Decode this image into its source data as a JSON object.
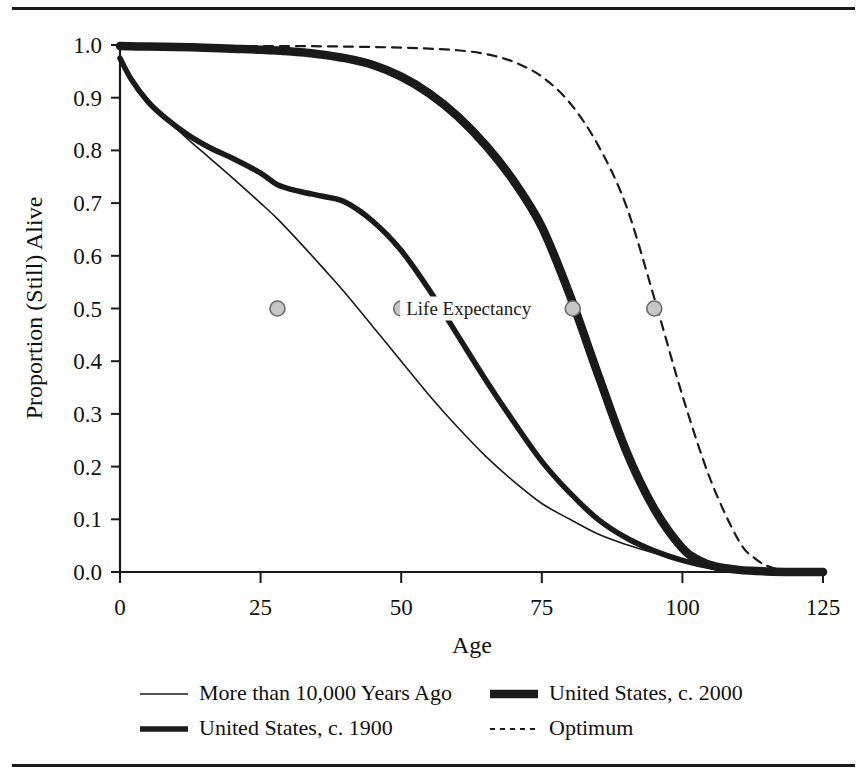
{
  "chart_data": {
    "type": "line",
    "title": "",
    "xlabel": "Age",
    "ylabel": "Proportion (Still) Alive",
    "xlim": [
      0,
      125
    ],
    "ylim": [
      0.0,
      1.0
    ],
    "grid": false,
    "legend_position": "bottom",
    "xticks": [
      "0",
      "25",
      "50",
      "75",
      "100",
      "125"
    ],
    "xtick_values": [
      0,
      25,
      50,
      75,
      100,
      125
    ],
    "yticks": [
      "0.0",
      "0.1",
      "0.2",
      "0.3",
      "0.4",
      "0.5",
      "0.6",
      "0.7",
      "0.8",
      "0.9",
      "1.0"
    ],
    "ytick_values": [
      0.0,
      0.1,
      0.2,
      0.3,
      0.4,
      0.5,
      0.6,
      0.7,
      0.8,
      0.9,
      1.0
    ],
    "annotations": [
      {
        "text": "Life Expectancy",
        "x": 62,
        "y": 0.5
      }
    ],
    "markers": {
      "label": "Life Expectancy",
      "y": 0.5,
      "fill": "#c6c6c6",
      "stroke": "#6b6b6b",
      "points": [
        {
          "series": "More than 10,000 Years Ago",
          "x": 28,
          "y": 0.5
        },
        {
          "series": "United States, c. 1900",
          "x": 50,
          "y": 0.5
        },
        {
          "series": "United States, c. 2000",
          "x": 80.5,
          "y": 0.5
        },
        {
          "series": "Optimum",
          "x": 95,
          "y": 0.5
        }
      ]
    },
    "series": [
      {
        "name": "More than 10,000 Years Ago",
        "style": "solid",
        "width": 1.6,
        "color": "#1a1a1a",
        "x": [
          0,
          2,
          5,
          8,
          12,
          16,
          20,
          25,
          28,
          32,
          36,
          40,
          45,
          50,
          55,
          60,
          65,
          70,
          75,
          80,
          85,
          90,
          95,
          100,
          105,
          110,
          115,
          120,
          125
        ],
        "y": [
          0.97,
          0.935,
          0.895,
          0.862,
          0.822,
          0.785,
          0.748,
          0.7,
          0.67,
          0.625,
          0.578,
          0.53,
          0.465,
          0.4,
          0.335,
          0.275,
          0.22,
          0.172,
          0.13,
          0.1,
          0.072,
          0.052,
          0.036,
          0.024,
          0.014,
          0.008,
          0.004,
          0.002,
          0.0
        ]
      },
      {
        "name": "United States, c. 1900",
        "style": "solid",
        "width": 5.5,
        "color": "#1a1a1a",
        "x": [
          0,
          2,
          5,
          8,
          12,
          16,
          20,
          25,
          28,
          32,
          36,
          40,
          45,
          50,
          55,
          60,
          65,
          70,
          75,
          80,
          85,
          90,
          95,
          100,
          105,
          110,
          115,
          120,
          125
        ],
        "y": [
          0.975,
          0.935,
          0.892,
          0.862,
          0.83,
          0.805,
          0.785,
          0.757,
          0.735,
          0.722,
          0.713,
          0.702,
          0.665,
          0.61,
          0.535,
          0.45,
          0.365,
          0.285,
          0.21,
          0.15,
          0.1,
          0.065,
          0.04,
          0.022,
          0.01,
          0.004,
          0.002,
          0.001,
          0.0
        ]
      },
      {
        "name": "United States, c. 2000",
        "style": "solid",
        "width": 8.5,
        "color": "#1a1a1a",
        "x": [
          0,
          5,
          10,
          15,
          20,
          25,
          30,
          35,
          40,
          45,
          50,
          55,
          60,
          65,
          70,
          75,
          80,
          85,
          90,
          95,
          100,
          103,
          106,
          110,
          115,
          120,
          125
        ],
        "y": [
          0.998,
          0.997,
          0.996,
          0.995,
          0.993,
          0.991,
          0.988,
          0.983,
          0.975,
          0.962,
          0.94,
          0.908,
          0.865,
          0.81,
          0.742,
          0.655,
          0.525,
          0.375,
          0.23,
          0.12,
          0.045,
          0.022,
          0.01,
          0.004,
          0.001,
          0.0,
          0.0
        ]
      },
      {
        "name": "Optimum",
        "style": "dashed",
        "width": 2.2,
        "color": "#1a1a1a",
        "x": [
          0,
          5,
          10,
          20,
          30,
          40,
          50,
          55,
          60,
          65,
          70,
          75,
          80,
          85,
          90,
          95,
          100,
          105,
          110,
          113,
          116,
          120,
          125
        ],
        "y": [
          0.999,
          0.999,
          0.999,
          0.998,
          0.998,
          0.997,
          0.995,
          0.993,
          0.99,
          0.983,
          0.968,
          0.94,
          0.89,
          0.81,
          0.695,
          0.52,
          0.335,
          0.175,
          0.06,
          0.025,
          0.008,
          0.0,
          0.0
        ]
      }
    ]
  },
  "legend": {
    "entries": [
      {
        "label": "More than 10,000 Years Ago",
        "style": "solid",
        "width": 1.6,
        "column": 0,
        "row": 0
      },
      {
        "label": "United States, c. 1900",
        "style": "solid",
        "width": 5.5,
        "column": 0,
        "row": 1
      },
      {
        "label": "United States, c. 2000",
        "style": "solid",
        "width": 8.5,
        "column": 1,
        "row": 0
      },
      {
        "label": "Optimum",
        "style": "dashed",
        "width": 2.2,
        "column": 1,
        "row": 1
      }
    ]
  }
}
